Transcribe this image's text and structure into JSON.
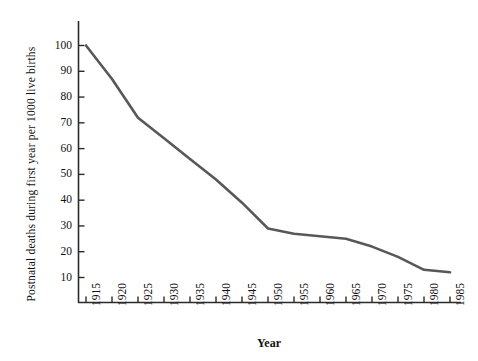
{
  "chart_data": {
    "type": "line",
    "title": "",
    "xlabel": "Year",
    "ylabel": "Postnatal deaths during first year per 1000 live births",
    "xlim": [
      1915,
      1985
    ],
    "ylim": [
      0,
      105
    ],
    "grid": false,
    "legend": null,
    "line_color": "#585858",
    "x": [
      1915,
      1920,
      1925,
      1930,
      1935,
      1940,
      1945,
      1950,
      1955,
      1960,
      1965,
      1970,
      1975,
      1980,
      1985
    ],
    "values": [
      100,
      87,
      72,
      64,
      56,
      48,
      39,
      29,
      27,
      26,
      25,
      22,
      18,
      13,
      12
    ],
    "xticks": [
      "1915",
      "1920",
      "1925",
      "1930",
      "1935",
      "1940",
      "1945",
      "1950",
      "1955",
      "1960",
      "1965",
      "1970",
      "1975",
      "1980",
      "1985"
    ],
    "yticks": [
      "10",
      "20",
      "30",
      "40",
      "50",
      "60",
      "70",
      "80",
      "90",
      "100"
    ],
    "ytick_values": [
      10,
      20,
      30,
      40,
      50,
      60,
      70,
      80,
      90,
      100
    ],
    "axis_color": "#2b2b2b"
  }
}
